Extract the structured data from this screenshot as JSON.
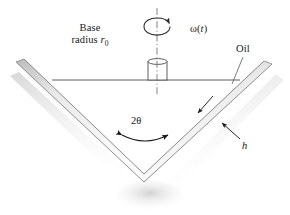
{
  "figure": {
    "background_color": "#ffffff",
    "line_color": "#4d4d4d",
    "wall_fill_light": "#f2f2f2",
    "wall_fill_mid": "#e0e0e0",
    "wall_edge_dark": "#9a9a9a",
    "shadow_color": "#d9d9d9"
  },
  "labels": {
    "base_radius_line1": "Base",
    "base_radius_line2_pre": "radius ",
    "base_radius_symbol": "r",
    "base_radius_subscript": "0",
    "omega_pre": "ω(",
    "omega_var": "t",
    "omega_post": ")",
    "oil": "Oil",
    "angle_number": "2",
    "angle_symbol": "θ",
    "thickness": "h"
  },
  "icons": {
    "rotation_arrow": "rotation-arrow-icon",
    "angle_arc_arrow": "double-headed-arc-arrow-icon",
    "leader_oil": "leader-line-icon",
    "leader_h": "leader-line-icon",
    "center_axis": "dash-dot-axis-icon"
  },
  "geometry": {
    "canvas_width": 290,
    "canvas_height": 215,
    "vertex_x": 144,
    "vertex_y": 182,
    "left_rim_x": 16,
    "left_rim_y": 62,
    "right_rim_x": 272,
    "right_rim_y": 64,
    "oil_surface_y": 80,
    "oil_surface_left_x": 52,
    "oil_surface_right_x": 240,
    "axis_x": 157,
    "axis_top_y": 8,
    "axis_bottom_y": 96,
    "shaft_left_x": 148,
    "shaft_right_x": 167,
    "shaft_top_y": 59,
    "wall_thickness_px": 9
  }
}
